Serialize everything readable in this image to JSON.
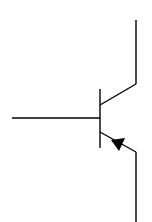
{
  "diagram": {
    "type": "pnp-transistor-symbol",
    "stroke_color": "#000000",
    "background": "#ffffff",
    "parts": {
      "base_lead": {
        "x1": 12,
        "y1": 118,
        "x2": 100,
        "y2": 118
      },
      "base_bar": {
        "x1": 100,
        "y1": 89,
        "x2": 100,
        "y2": 148
      },
      "collector_diag": {
        "x1": 100,
        "y1": 105,
        "x2": 136,
        "y2": 84
      },
      "collector_lead": {
        "x1": 136,
        "y1": 84,
        "x2": 136,
        "y2": 20
      },
      "emitter_diag": {
        "x1": 100,
        "y1": 132,
        "x2": 136,
        "y2": 152
      },
      "emitter_lead": {
        "x1": 136,
        "y1": 152,
        "x2": 136,
        "y2": 222
      },
      "arrow": {
        "points": "111,140 124,138 119,150",
        "direction": "toward-base"
      }
    }
  }
}
